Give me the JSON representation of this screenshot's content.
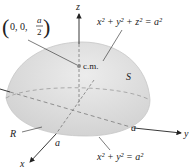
{
  "diagram": {
    "type": "hemisphere-center-of-mass",
    "labels": {
      "z_axis": "z",
      "x_axis": "x",
      "y_axis": "y",
      "surface": "S",
      "region": "R",
      "radius_x": "a",
      "radius_y": "a",
      "center_of_mass": "c.m.",
      "point_prefix": "0, 0,",
      "point_fraction_num": "a",
      "point_fraction_den": "2",
      "sphere_eq_main": "x",
      "sphere_equation": "x² + y² + z² = a²",
      "circle_equation": "x² + y² = a²"
    },
    "colors": {
      "hemisphere_fill": "#dcdcdc",
      "hemisphere_edge": "#c8c8c8",
      "axis": "#222222",
      "dashed": "#7a7a7a",
      "cm_dot": "#888888"
    }
  }
}
